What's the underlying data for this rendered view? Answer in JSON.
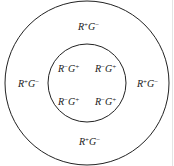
{
  "diagram": {
    "outer_region": {
      "labels": [
        {
          "r": "R",
          "rs": "+",
          "g": "G",
          "gs": "−",
          "pos": "top"
        },
        {
          "r": "R",
          "rs": "+",
          "g": "G",
          "gs": "−",
          "pos": "left"
        },
        {
          "r": "R",
          "rs": "+",
          "g": "G",
          "gs": "−",
          "pos": "right"
        },
        {
          "r": "R",
          "rs": "+",
          "g": "G",
          "gs": "−",
          "pos": "bottom"
        }
      ]
    },
    "inner_region": {
      "labels": [
        {
          "r": "R",
          "rs": "−",
          "g": "G",
          "gs": "+",
          "pos": "top-left"
        },
        {
          "r": "R",
          "rs": "−",
          "g": "G",
          "gs": "+",
          "pos": "top-right"
        },
        {
          "r": "R",
          "rs": "−",
          "g": "G",
          "gs": "+",
          "pos": "bottom-left"
        },
        {
          "r": "R",
          "rs": "−",
          "g": "G",
          "gs": "+",
          "pos": "bottom-right"
        }
      ]
    },
    "stroke_color": "#222222"
  }
}
